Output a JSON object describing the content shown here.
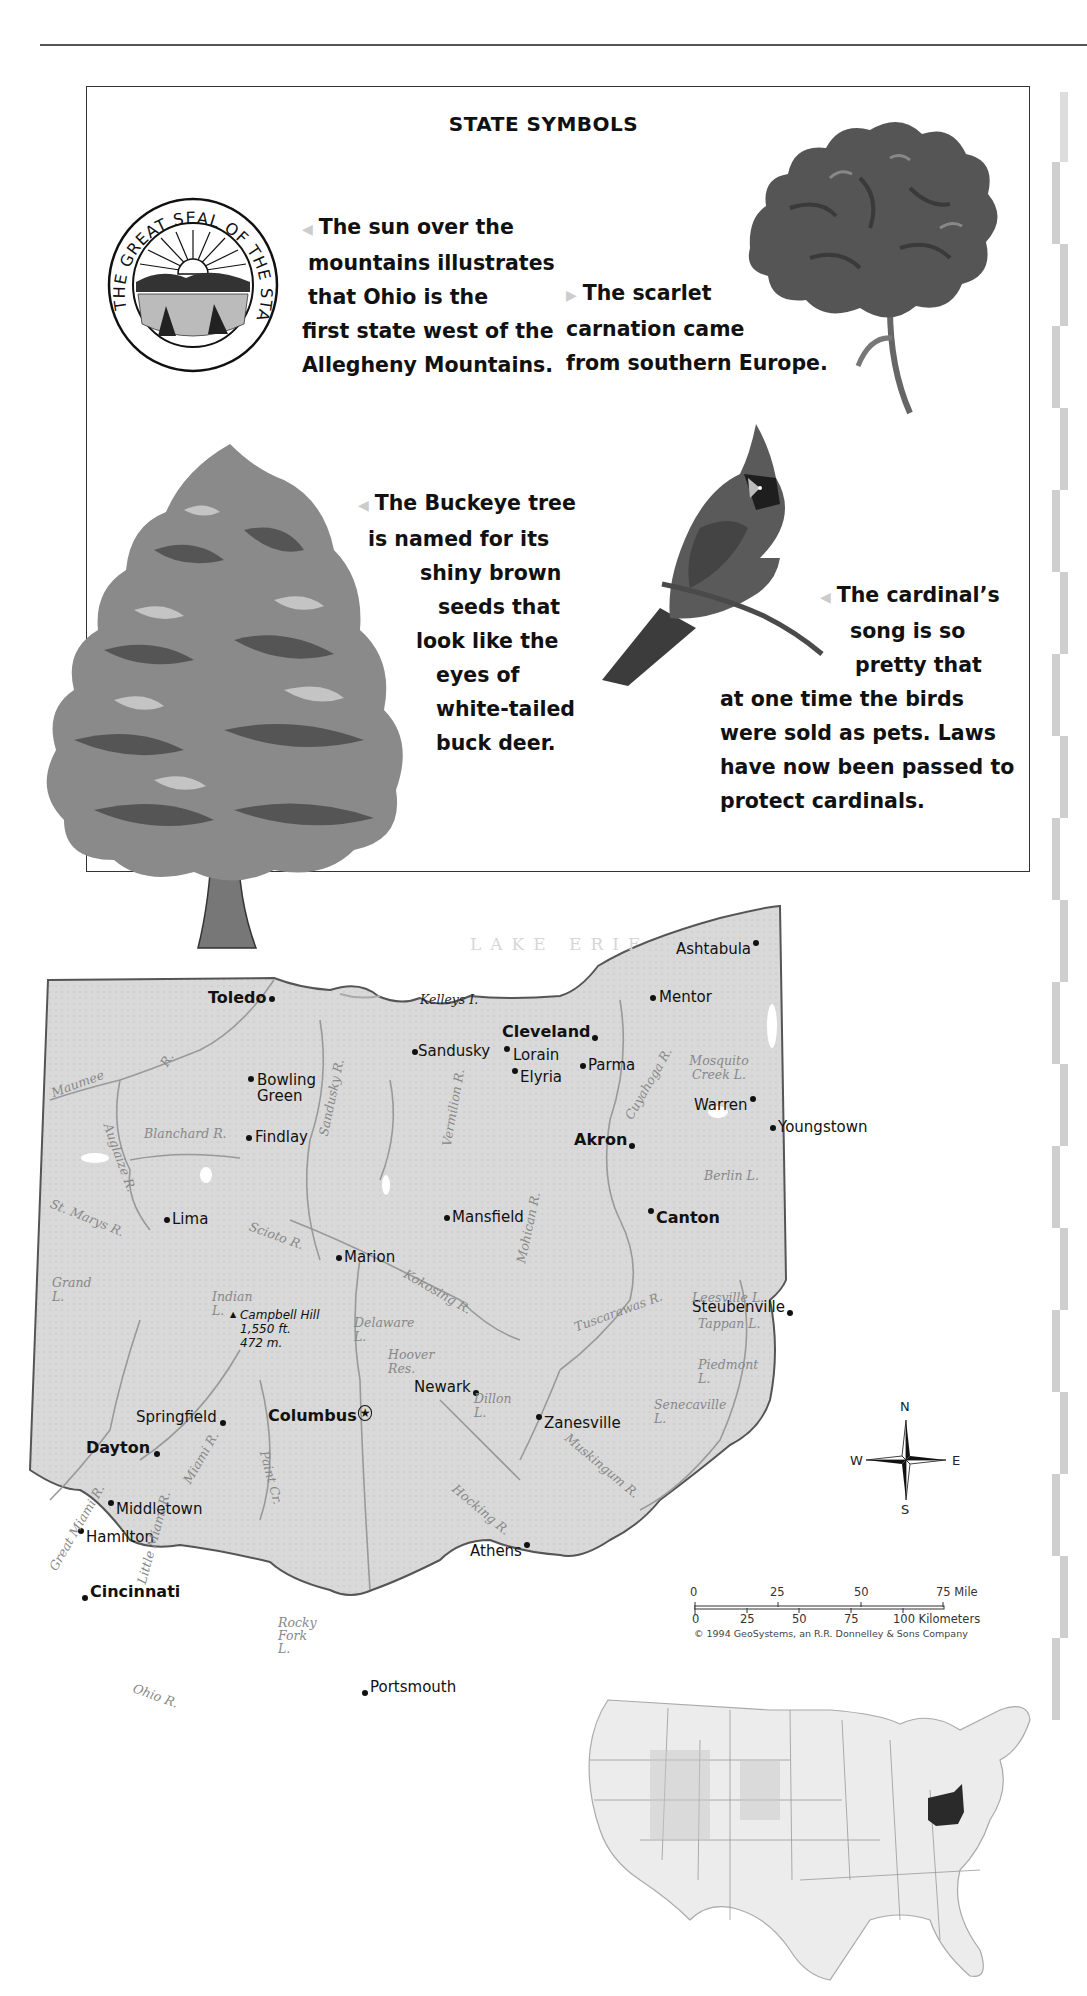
{
  "page": {
    "section_title": "STATE SYMBOLS"
  },
  "symbols": {
    "seal": {
      "icon": "ohio-great-seal",
      "ring_text": "THE GREAT SEAL OF THE STATE OF OHIO",
      "caption_lines": [
        "The sun over the",
        "mountains illustrates",
        "that Ohio is the",
        "first state west of the",
        "Allegheny Mountains."
      ]
    },
    "flower": {
      "icon": "scarlet-carnation",
      "caption_lines": [
        "The scarlet",
        "carnation came",
        "from southern Europe."
      ]
    },
    "tree": {
      "icon": "buckeye-tree",
      "caption_lines": [
        "The Buckeye tree",
        "is named for its",
        "shiny brown",
        "seeds that",
        "look like the",
        "eyes of",
        "white-tailed",
        "buck deer."
      ]
    },
    "bird": {
      "icon": "cardinal-bird",
      "caption_lines": [
        "The cardinal’s",
        "song is so",
        "pretty that",
        "at one time the birds",
        "were sold as pets. Laws",
        "have now been passed to",
        "protect cardinals."
      ]
    }
  },
  "map": {
    "lake_label": "LAKE ERIE",
    "capital": "Columbus",
    "cities": [
      {
        "name": "Toledo",
        "bold": true
      },
      {
        "name": "Bowling Green",
        "bold": false
      },
      {
        "name": "Findlay",
        "bold": false
      },
      {
        "name": "Sandusky",
        "bold": false
      },
      {
        "name": "Cleveland",
        "bold": true
      },
      {
        "name": "Lorain",
        "bold": false
      },
      {
        "name": "Elyria",
        "bold": false
      },
      {
        "name": "Parma",
        "bold": false
      },
      {
        "name": "Mentor",
        "bold": false
      },
      {
        "name": "Ashtabula",
        "bold": false
      },
      {
        "name": "Warren",
        "bold": false
      },
      {
        "name": "Youngstown",
        "bold": false
      },
      {
        "name": "Akron",
        "bold": true
      },
      {
        "name": "Canton",
        "bold": true
      },
      {
        "name": "Lima",
        "bold": false
      },
      {
        "name": "Mansfield",
        "bold": false
      },
      {
        "name": "Marion",
        "bold": false
      },
      {
        "name": "Steubenville",
        "bold": false
      },
      {
        "name": "Newark",
        "bold": false
      },
      {
        "name": "Zanesville",
        "bold": false
      },
      {
        "name": "Springfield",
        "bold": false
      },
      {
        "name": "Columbus",
        "bold": true
      },
      {
        "name": "Dayton",
        "bold": true
      },
      {
        "name": "Middletown",
        "bold": false
      },
      {
        "name": "Hamilton",
        "bold": false
      },
      {
        "name": "Cincinnati",
        "bold": true
      },
      {
        "name": "Athens",
        "bold": false
      },
      {
        "name": "Portsmouth",
        "bold": false
      }
    ],
    "water_features": [
      "Kelleys I.",
      "Maumee",
      "R.",
      "Auglaize R.",
      "Blanchard R.",
      "Sandusky R.",
      "Vermilion R.",
      "Cuyahoga R.",
      "Mosquito Creek L.",
      "Berlin L.",
      "St. Marys R.",
      "Grand L.",
      "Indian L.",
      "Scioto R.",
      "Kokosing R.",
      "Delaware L.",
      "Mohican R.",
      "Tuscarawas R.",
      "Leesville L.",
      "Tappan L.",
      "Piedmont L.",
      "Hoover Res.",
      "Dillon L.",
      "Senecaville L.",
      "Muskingum R.",
      "Miami R.",
      "Great Miami R.",
      "Little Miami R.",
      "Paint Cr.",
      "Hocking R.",
      "Rocky Fork L.",
      "Ohio R."
    ],
    "high_point": {
      "name": "Campbell Hill",
      "feet": "1,550 ft.",
      "meters": "472 m."
    },
    "compass": {
      "n": "N",
      "s": "S",
      "e": "E",
      "w": "W"
    },
    "scale": {
      "miles": [
        "0",
        "25",
        "50",
        "75 Mile"
      ],
      "kilometers": [
        "0",
        "25",
        "50",
        "75",
        "100 Kilometers"
      ]
    },
    "copyright": "© 1994 GeoSystems, an R.R. Donnelley & Sons Company",
    "locator": {
      "highlighted_state": "Ohio",
      "highlight_color": "#2a2a2a"
    }
  }
}
